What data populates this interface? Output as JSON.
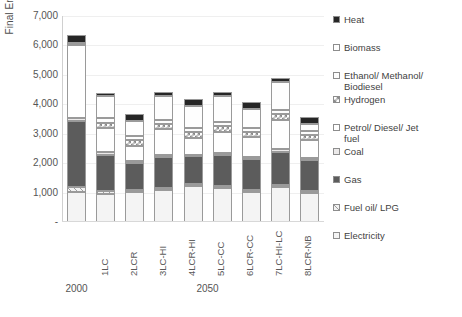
{
  "chart_data": {
    "type": "bar",
    "subtype": "stacked-column",
    "title": "",
    "xlabel": "",
    "ylabel": "Final Energy (PJ)",
    "ylim": [
      0,
      7000
    ],
    "ytick_values": [
      0,
      1000,
      2000,
      3000,
      4000,
      5000,
      6000,
      7000
    ],
    "ytick_labels": [
      "-",
      "1,000",
      "2,000",
      "3,000",
      "4,000",
      "5,000",
      "6,000",
      "7,000"
    ],
    "grid": true,
    "legend_position": "right",
    "categories": [
      "2000",
      "1LC",
      "2LCR",
      "3LC-HI",
      "4LCR-HI",
      "5LC-CC",
      "6LCR-CC",
      "7LC-HI-LC",
      "8LCR-NB"
    ],
    "group_labels": [
      {
        "label": "2000",
        "categories": [
          "2000"
        ]
      },
      {
        "label": "2050",
        "categories": [
          "1LC",
          "2LCR",
          "3LC-HI",
          "4LCR-HI",
          "5LC-CC",
          "6LCR-CC",
          "7LC-HI-LC",
          "8LCR-NB"
        ]
      }
    ],
    "stack_order_bottom_to_top": [
      "Electricity",
      "Fuel oil/ LPG",
      "Gas",
      "Coal",
      "Petrol/ Diesel/ Jet fuel",
      "Hydrogen",
      "Ethanol/ Methanol/ Biodiesel",
      "Biomass",
      "Heat"
    ],
    "series": [
      {
        "name": "Electricity",
        "values": [
          1030,
          960,
          1030,
          1100,
          1230,
          1170,
          1030,
          1180,
          1000
        ]
      },
      {
        "name": "Fuel oil/ LPG",
        "values": [
          170,
          90,
          60,
          60,
          70,
          60,
          70,
          80,
          60
        ]
      },
      {
        "name": "Gas",
        "values": [
          2230,
          1230,
          900,
          1060,
          930,
          1040,
          1050,
          1130,
          1050
        ]
      },
      {
        "name": "Coal",
        "values": [
          90,
          90,
          70,
          70,
          60,
          70,
          70,
          90,
          70
        ]
      },
      {
        "name": "Petrol/ Diesel/ Jet fuel",
        "values": [
          2500,
          820,
          530,
          860,
          570,
          730,
          660,
          1000,
          600
        ]
      },
      {
        "name": "Hydrogen",
        "values": [
          0,
          190,
          190,
          190,
          200,
          200,
          180,
          200,
          190
        ]
      },
      {
        "name": "Ethanol/ Methanol/ Biodiesel",
        "values": [
          0,
          160,
          130,
          130,
          140,
          140,
          130,
          140,
          130
        ]
      },
      {
        "name": "Biomass",
        "values": [
          80,
          740,
          510,
          820,
          740,
          880,
          650,
          940,
          230
        ]
      },
      {
        "name": "Heat",
        "values": [
          250,
          120,
          260,
          120,
          250,
          130,
          240,
          130,
          230
        ]
      }
    ],
    "totals": [
      6350,
      4400,
      3680,
      4410,
      4190,
      4420,
      4080,
      4890,
      3560
    ]
  },
  "legend": {
    "entries": [
      {
        "label": "Heat",
        "label2": "",
        "swatch": "heat",
        "style": "solid-dark"
      },
      {
        "label": "Biomass",
        "label2": "",
        "swatch": "biomass",
        "style": "solid-white"
      },
      {
        "label": "Ethanol/ Methanol/",
        "label2": "Biodiesel",
        "swatch": "ethanol",
        "style": "solid-white"
      },
      {
        "label": "Hydrogen",
        "label2": "",
        "swatch": "hydrogen",
        "style": "checker"
      },
      {
        "label": "Petrol/ Diesel/ Jet",
        "label2": "fuel",
        "swatch": "petrol",
        "style": "solid-white"
      },
      {
        "label": "Coal",
        "label2": "",
        "swatch": "coal",
        "style": "solid-lightgrey"
      },
      {
        "label": "Gas",
        "label2": "",
        "swatch": "gas",
        "style": "solid-midgrey"
      },
      {
        "label": "Fuel oil/ LPG",
        "label2": "",
        "swatch": "fueloil",
        "style": "diagonal-hatch"
      },
      {
        "label": "Electricity",
        "label2": "",
        "swatch": "electricity",
        "style": "solid-white"
      }
    ]
  },
  "colors": {
    "heat": "#262626",
    "biomass": "#fefefe",
    "ethanol": "#fdfdfd",
    "hydrogen": "#ffffff",
    "petrol": "#ffffff",
    "coal": "#eceaea",
    "gas": "#5c5c5c",
    "fueloil": "#f2f2f2",
    "electricity": "#f4f4f4",
    "gridline": "#efefef",
    "outline": "#9a9a9a",
    "text": "#4a4a4a",
    "background": "#ffffff"
  }
}
